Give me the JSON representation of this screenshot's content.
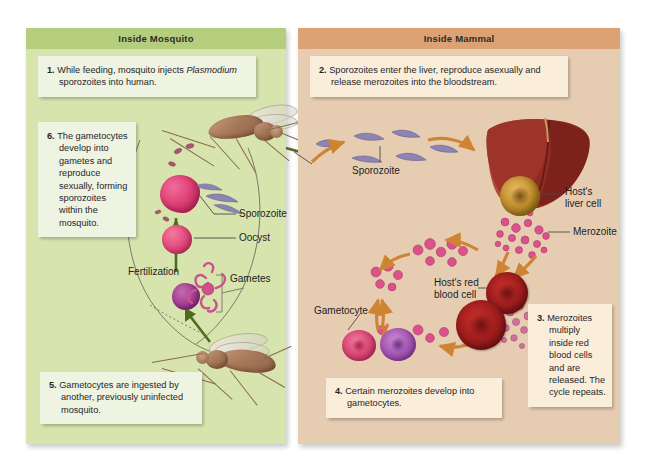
{
  "figure": {
    "colors": {
      "mosquito_panel_bg": "#d8e4ae",
      "mosquito_header_bg": "#b5ce7e",
      "mammal_panel_bg": "#e6cdb2",
      "mammal_header_bg": "#dda273",
      "green_callout_bg": "#eef3e2",
      "tan_callout_bg": "#faeedb",
      "orange_arrow": "#cf8434",
      "green_arrow": "#4e6b1f",
      "leader_line": "#4a4a46"
    }
  },
  "panels": [
    {
      "id": "mosquito",
      "header": "Inside Mosquito",
      "callouts": [
        {
          "id": "callout-1",
          "number": "1.",
          "text_before": "While feeding, mosquito injects ",
          "emphasis": "Plasmodium",
          "text_after": " sporozoites into human."
        },
        {
          "id": "callout-6",
          "number": "6.",
          "text": "The gametocytes develop into gametes and reproduce sexually, forming sporozoites within the mosquito."
        },
        {
          "id": "callout-5",
          "number": "5.",
          "text": "Gametocytes are ingested by another, previously uninfected mosquito."
        }
      ],
      "labels": [
        {
          "id": "label-sporozoite-mosquito",
          "text": "Sporozoite"
        },
        {
          "id": "label-oocyst",
          "text": "Oocyst"
        },
        {
          "id": "label-fertilization",
          "text": "Fertilization"
        },
        {
          "id": "label-gametes",
          "text": "Gametes"
        }
      ]
    },
    {
      "id": "mammal",
      "header": "Inside Mammal",
      "callouts": [
        {
          "id": "callout-2",
          "number": "2.",
          "text": "Sporozoites enter the liver, reproduce asexually and release merozoites into the bloodstream."
        },
        {
          "id": "callout-3",
          "number": "3.",
          "text": "Merozoites multiply inside red blood cells and are released. The cycle repeats."
        },
        {
          "id": "callout-4",
          "number": "4.",
          "text": "Certain merozoites develop into gametocytes."
        }
      ],
      "labels": [
        {
          "id": "label-sporozoite-mammal",
          "text": "Sporozoite"
        },
        {
          "id": "label-hosts-liver-cell-line1",
          "text": "Host's"
        },
        {
          "id": "label-hosts-liver-cell-line2",
          "text": "liver cell"
        },
        {
          "id": "label-merozoite",
          "text": "Merozoite"
        },
        {
          "id": "label-hosts-red-blood-cell-line1",
          "text": "Host's red"
        },
        {
          "id": "label-hosts-red-blood-cell-line2",
          "text": "blood cell"
        },
        {
          "id": "label-gametocyte",
          "text": "Gametocyte"
        }
      ]
    }
  ]
}
